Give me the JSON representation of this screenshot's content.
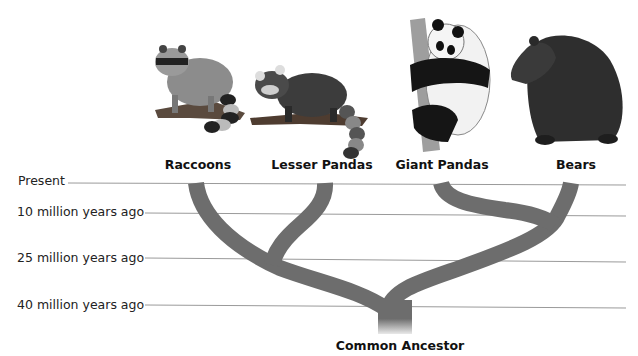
{
  "diagram": {
    "type": "phylogenetic-tree",
    "branch_color": "#6d6d6d",
    "line_color": "#9a9a9a",
    "timeline": [
      {
        "label": "Present",
        "mya": 0
      },
      {
        "label": "10 million years ago",
        "mya": 10
      },
      {
        "label": "25 million years ago",
        "mya": 25
      },
      {
        "label": "40 million years ago",
        "mya": 40
      }
    ],
    "taxa": [
      {
        "label": "Raccoons",
        "icon": "raccoon-illustration"
      },
      {
        "label": "Lesser Pandas",
        "icon": "red-panda-illustration"
      },
      {
        "label": "Giant Pandas",
        "icon": "giant-panda-illustration"
      },
      {
        "label": "Bears",
        "icon": "bear-illustration"
      }
    ],
    "splits": [
      {
        "between": [
          "Raccoons + Lesser Pandas",
          "Giant Pandas + Bears"
        ],
        "mya": 40
      },
      {
        "between": [
          "Raccoons",
          "Lesser Pandas"
        ],
        "mya": 25
      },
      {
        "between": [
          "Giant Pandas",
          "Bears"
        ],
        "mya": 10
      }
    ],
    "root_label": "Common Ancestor"
  }
}
